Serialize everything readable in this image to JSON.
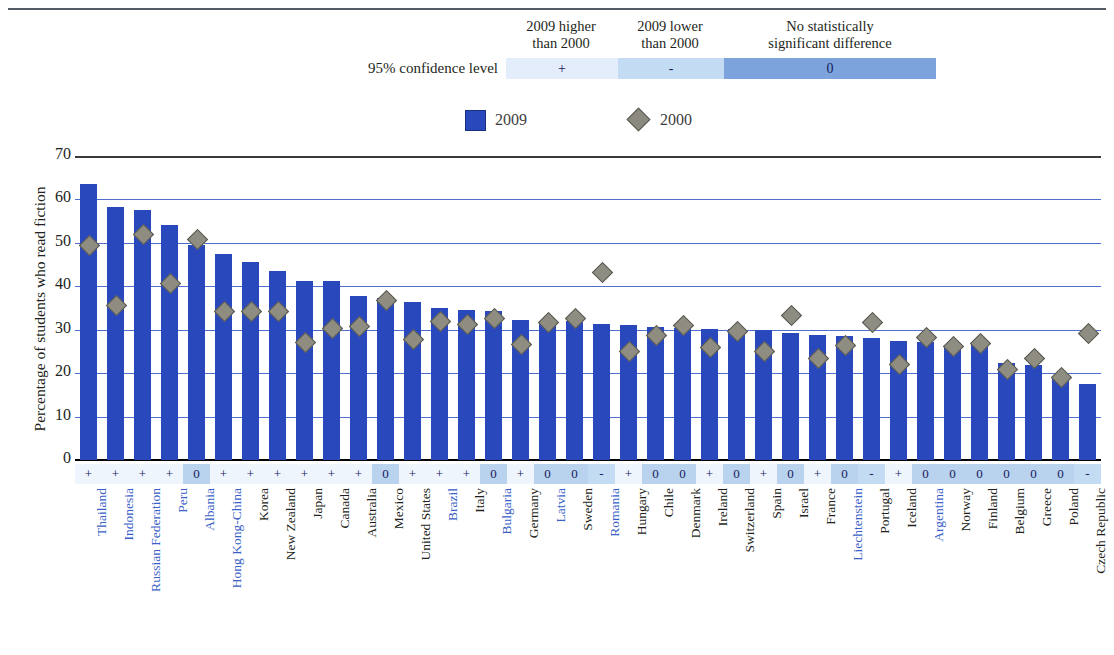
{
  "significance_legend": {
    "confidence_label": "95% confidence level",
    "headers": [
      "2009 higher\nthan 2000",
      "2009 lower\nthan 2000",
      "No statistically\nsignificant difference"
    ],
    "header_higher_line1": "2009 higher",
    "header_higher_line2": "than 2000",
    "header_lower_line1": "2009 lower",
    "header_lower_line2": "than 2000",
    "header_nodiff_line1": "No statistically",
    "header_nodiff_line2": "significant difference",
    "symbol_higher": "+",
    "symbol_lower": "-",
    "symbol_nodiff": "0",
    "color_higher": "#e3edfb",
    "color_lower": "#c3dcf3",
    "color_nodiff": "#7da3dd"
  },
  "series_legend": {
    "items": [
      {
        "label": "2009",
        "marker": "square",
        "color": "#2948bb"
      },
      {
        "label": "2000",
        "marker": "diamond",
        "color": "#8c8a80"
      }
    ]
  },
  "chart_data": {
    "type": "bar",
    "title": "",
    "xlabel": "",
    "ylabel": "Percentage of students who read fiction",
    "ylim": [
      0,
      70
    ],
    "yticks": [
      0,
      10,
      20,
      30,
      40,
      50,
      60,
      70
    ],
    "grid": true,
    "legend_position": "top-center",
    "categories": [
      "Thailand",
      "Indonesia",
      "Russian Federation",
      "Peru",
      "Albania",
      "Hong Kong-China",
      "Korea",
      "New Zealand",
      "Japan",
      "Canada",
      "Australia",
      "Mexico",
      "United States",
      "Brazil",
      "Italy",
      "Bulgaria",
      "Germany",
      "Latvia",
      "Sweden",
      "Romania",
      "Hungary",
      "Chile",
      "Denmark",
      "Ireland",
      "Switzerland",
      "Spain",
      "Israel",
      "France",
      "Liechtenstein",
      "Portugal",
      "Iceland",
      "Argentina",
      "Norway",
      "Finland",
      "Belgium",
      "Greece",
      "Poland",
      "Czech Republic"
    ],
    "partner_countries": [
      "Thailand",
      "Indonesia",
      "Russian Federation",
      "Peru",
      "Albania",
      "Hong Kong-China",
      "Brazil",
      "Bulgaria",
      "Latvia",
      "Romania",
      "Liechtenstein",
      "Argentina"
    ],
    "series": [
      {
        "name": "2009",
        "marker": "bar",
        "values": [
          63.6,
          58.2,
          57.6,
          54.2,
          49.5,
          47.4,
          45.7,
          43.5,
          41.2,
          41.2,
          37.7,
          37.3,
          36.3,
          35.0,
          34.5,
          34.4,
          32.3,
          32.0,
          32.1,
          31.3,
          31.2,
          30.6,
          30.4,
          30.1,
          30.1,
          30.0,
          29.3,
          28.8,
          28.6,
          28.2,
          27.3,
          27.1,
          26.4,
          26.8,
          22.4,
          21.8,
          19.4,
          17.6
        ]
      },
      {
        "name": "2000",
        "marker": "diamond",
        "values": [
          49.5,
          35.7,
          52.1,
          40.8,
          51.0,
          34.4,
          34.2,
          34.2,
          27.2,
          30.5,
          30.8,
          36.8,
          27.9,
          31.9,
          31.3,
          32.6,
          26.7,
          31.8,
          32.8,
          43.2,
          25.0,
          28.8,
          31.2,
          26.0,
          29.8,
          25.2,
          33.4,
          23.4,
          26.4,
          31.7,
          22.1,
          28.3,
          26.2,
          27.0,
          20.9,
          23.6,
          19.1,
          29.3
        ]
      }
    ],
    "significance": [
      "+",
      "+",
      "+",
      "+",
      "0",
      "+",
      "+",
      "+",
      "+",
      "+",
      "+",
      "0",
      "+",
      "+",
      "+",
      "0",
      "+",
      "0",
      "0",
      "-",
      "+",
      "0",
      "0",
      "+",
      "0",
      "+",
      "0",
      "+",
      "0",
      "-",
      "+",
      "0",
      "0",
      "0",
      "0",
      "0",
      "0",
      "-"
    ]
  }
}
